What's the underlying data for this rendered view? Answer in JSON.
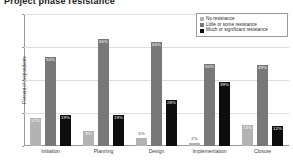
{
  "title": "Project phase resistance",
  "chart_data": {
    "type": "bar",
    "title": "Project phase resistance",
    "xlabel": "",
    "ylabel": "Percent of respondents",
    "ylim": [
      0,
      80
    ],
    "yticks": [
      0,
      20,
      40,
      60,
      80
    ],
    "ytick_labels": [
      "0%",
      "20%",
      "40%",
      "60%",
      "80%"
    ],
    "grid": true,
    "legend_position": "top-right",
    "categories": [
      "Initiation",
      "Planning",
      "Design",
      "Implementation",
      "Closure"
    ],
    "series": [
      {
        "name": "No resistance",
        "color": "#b3b3b3",
        "values": [
          17,
          9,
          5,
          2,
          13
        ],
        "labels": [
          "17%",
          "9%",
          "5%",
          "2%",
          "13%"
        ]
      },
      {
        "name": "Little or some resistance",
        "color": "#787878",
        "values": [
          54,
          65,
          63,
          50,
          49
        ],
        "labels": [
          "54%",
          "65%",
          "63%",
          "50%",
          "49%"
        ]
      },
      {
        "name": "Much or significant resistance",
        "color": "#0d0d0d",
        "values": [
          19,
          19,
          28,
          39,
          12
        ],
        "labels": [
          "19%",
          "19%",
          "28%",
          "39%",
          "12%"
        ]
      }
    ]
  }
}
